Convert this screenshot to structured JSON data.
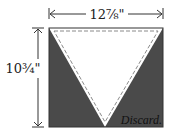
{
  "diagram": {
    "width_label": "12⅞\"",
    "height_label": "10¾\"",
    "discard_label": "Discard.",
    "colors": {
      "dark_fill": "#4a4a4a",
      "triangle_fill": "#ffffff",
      "line": "#333333",
      "dashed_seam": "#8a8a8a"
    }
  }
}
